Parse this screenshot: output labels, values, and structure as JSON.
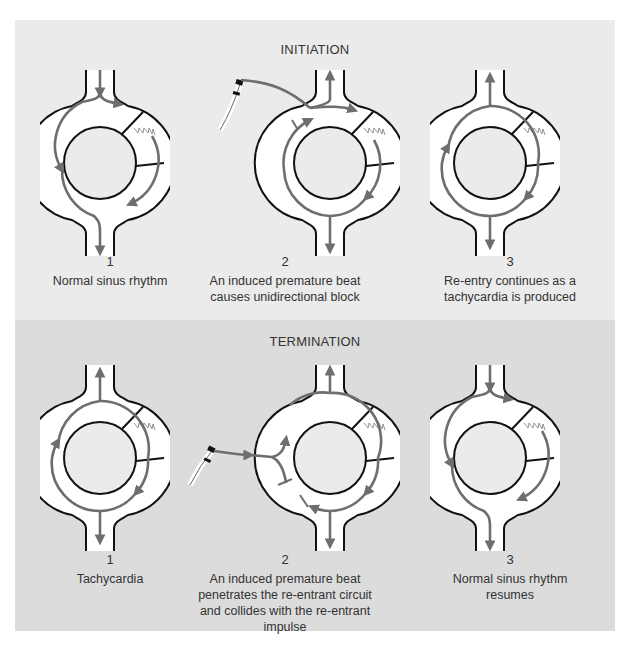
{
  "sections": [
    {
      "title": "INITIATION",
      "steps": [
        {
          "number": "1",
          "caption": "Normal sinus rhythm"
        },
        {
          "number": "2",
          "caption": "An induced premature beat causes unidirectional block"
        },
        {
          "number": "3",
          "caption": "Re-entry continues as a tachycardia is produced"
        }
      ]
    },
    {
      "title": "TERMINATION",
      "steps": [
        {
          "number": "1",
          "caption": "Tachycardia"
        },
        {
          "number": "2",
          "caption": "An induced premature beat penetrates the re-entrant circuit and collides with the re-entrant impulse"
        },
        {
          "number": "3",
          "caption": "Normal sinus rhythm resumes"
        }
      ]
    }
  ],
  "colors": {
    "panel_top": "#ebebeb",
    "panel_bottom": "#dcdcdc",
    "impulse": "#6e6e6e",
    "outline": "#111111"
  }
}
